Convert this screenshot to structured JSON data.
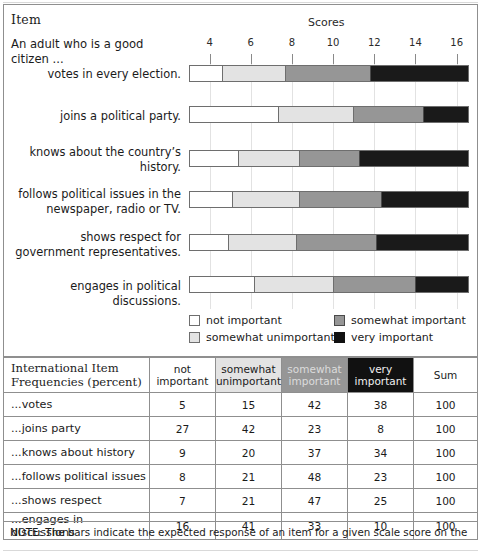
{
  "figure": {
    "item_header": "Item",
    "scores_header": "Scores",
    "stem": "An adult who is a good citizen ...",
    "axis": {
      "min": 3.0,
      "max": 16.6,
      "ticks": [
        4,
        6,
        8,
        10,
        12,
        14,
        16
      ],
      "tick_labels": [
        "4",
        "6",
        "8",
        "10",
        "12",
        "14",
        "16"
      ]
    },
    "legend": [
      {
        "key": "not_important",
        "label": "not important",
        "color": "#ffffff"
      },
      {
        "key": "somewhat_unimportant",
        "label": "somewhat unimportant",
        "color": "#e3e3e3"
      },
      {
        "key": "somewhat_important",
        "label": "somewhat important",
        "color": "#969696"
      },
      {
        "key": "very_important",
        "label": "very important",
        "color": "#1a1a1a"
      }
    ],
    "rows": [
      {
        "label": "votes in every election."
      },
      {
        "label": "joins a political party."
      },
      {
        "label": "knows about the country’s history."
      },
      {
        "label": "follows political issues in the newspaper, radio or TV."
      },
      {
        "label": "shows respect for government representatives."
      },
      {
        "label": "engages in political discussions."
      }
    ]
  },
  "chart_data": {
    "type": "bar",
    "orientation": "horizontal-stacked",
    "title": "Scores",
    "xlabel": "Scores",
    "ylabel": "Item",
    "xlim": [
      3.0,
      16.6
    ],
    "xticks": [
      4,
      6,
      8,
      10,
      12,
      14,
      16
    ],
    "grid": true,
    "legend_position": "below-plot",
    "categories": [
      "votes in every election.",
      "joins a political party.",
      "knows about the country’s history.",
      "follows political issues in the newspaper, radio or TV.",
      "shows respect for government representatives.",
      "engages in political discussions."
    ],
    "series": [
      {
        "name": "not important",
        "color": "#ffffff",
        "threshold_scores": [
          4.6,
          7.3,
          5.4,
          5.1,
          4.9,
          6.2
        ]
      },
      {
        "name": "somewhat unimportant",
        "color": "#e3e3e3",
        "threshold_scores": [
          7.7,
          10.9,
          8.4,
          8.4,
          8.2,
          10.0
        ]
      },
      {
        "name": "somewhat important",
        "color": "#969696",
        "threshold_scores": [
          11.3,
          14.3,
          11.3,
          12.4,
          12.2,
          14.0
        ]
      },
      {
        "name": "very important",
        "color": "#1a1a1a",
        "threshold_scores": [
          16.6,
          16.6,
          16.6,
          16.6,
          16.6,
          16.6
        ]
      }
    ],
    "segment_boundaries_px": {
      "note": "left edge of plot = score 3.0, right edge = score 16.6",
      "rows": [
        {
          "label": "votes in every election.",
          "b1": 33,
          "b2": 96,
          "b3": 181,
          "end": 280
        },
        {
          "label": "joins a political party.",
          "b1": 89,
          "b2": 164,
          "b3": 234,
          "end": 280
        },
        {
          "label": "knows about the country’s history.",
          "b1": 49,
          "b2": 110,
          "b3": 170,
          "end": 280
        },
        {
          "label": "follows political issues in the newspaper, radio or TV.",
          "b1": 43,
          "b2": 110,
          "b3": 192,
          "end": 280
        },
        {
          "label": "shows respect for government representatives.",
          "b1": 39,
          "b2": 107,
          "b3": 187,
          "end": 280
        },
        {
          "label": "engages in political discussions.",
          "b1": 65,
          "b2": 144,
          "b3": 226,
          "end": 280
        }
      ]
    }
  },
  "table": {
    "title": "International Item Frequencies (percent)",
    "columns": [
      "not important",
      "somewhat unimportant",
      "somewhat important",
      "very important",
      "Sum"
    ],
    "column_colors": [
      "#ffffff",
      "#e3e3e3",
      "#969696",
      "#111111",
      "#ffffff"
    ],
    "rows": [
      {
        "label": "...votes",
        "values": [
          "5",
          "15",
          "42",
          "38"
        ],
        "sum": "100"
      },
      {
        "label": "...joins party",
        "values": [
          "27",
          "42",
          "23",
          "8"
        ],
        "sum": "100"
      },
      {
        "label": "...knows about history",
        "values": [
          "9",
          "20",
          "37",
          "34"
        ],
        "sum": "100"
      },
      {
        "label": "...follows political issues",
        "values": [
          "8",
          "21",
          "48",
          "23"
        ],
        "sum": "100"
      },
      {
        "label": "...shows respect",
        "values": [
          "7",
          "21",
          "47",
          "25"
        ],
        "sum": "100"
      },
      {
        "label": "...engages in discussions",
        "values": [
          "16",
          "41",
          "33",
          "10"
        ],
        "sum": "100"
      }
    ]
  },
  "note": "NOTE: The bars indicate the expected response of an item for a given scale score on the"
}
